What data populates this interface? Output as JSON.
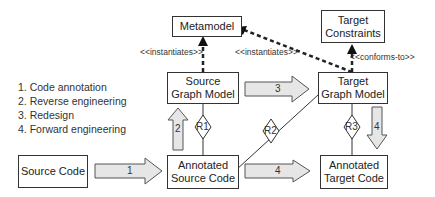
{
  "legend": [
    "1. Code annotation",
    "2. Reverse engineering",
    "3. Redesign",
    "4. Forward engineering"
  ],
  "nodes": {
    "metamodel": "Metamodel",
    "target_constraints": [
      "Target",
      "Constraints"
    ],
    "source_graph_model": [
      "Source",
      "Graph Model"
    ],
    "target_graph_model": [
      "Target",
      "Graph Model"
    ],
    "source_code": "Source Code",
    "annotated_source_code": [
      "Annotated",
      "Source Code"
    ],
    "annotated_target_code": [
      "Annotated",
      "Target Code"
    ]
  },
  "edges": {
    "instantiates_1": "<<instantiates>>",
    "instantiates_2": "<<instantiates>>",
    "conforms_to": "<<conforms-to>>",
    "arrow_1": "1",
    "arrow_2": "2",
    "arrow_3": "3",
    "arrow_4a": "4",
    "arrow_4b": "4"
  },
  "relations": {
    "r1": "R1",
    "r2": "R2",
    "r3": "R3"
  },
  "colors": {
    "arrow_fill": "#e6e6e6",
    "stroke": "#333333"
  }
}
